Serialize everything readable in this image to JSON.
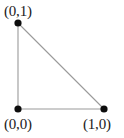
{
  "diagram": {
    "background_color": "#ffffff",
    "edge_color": "#9a9a9a",
    "vertex_color": "#0d0d0d",
    "label_color": "#1a1a1a",
    "vertices": [
      {
        "id": "top-left",
        "label": "(0,1)",
        "x": 18,
        "y": 23
      },
      {
        "id": "origin",
        "label": "(0,0)",
        "x": 18,
        "y": 109
      },
      {
        "id": "bottom-right",
        "label": "(1,0)",
        "x": 104,
        "y": 109
      }
    ],
    "edges": [
      {
        "id": "left-leg",
        "from": "top-left",
        "to": "origin"
      },
      {
        "id": "bottom-leg",
        "from": "origin",
        "to": "bottom-right"
      },
      {
        "id": "hypotenuse",
        "from": "top-left",
        "to": "bottom-right"
      }
    ]
  },
  "chart_data": {
    "type": "scatter",
    "title": "",
    "xlabel": "",
    "ylabel": "",
    "xlim": [
      0,
      1
    ],
    "ylim": [
      0,
      1
    ],
    "grid": false,
    "legend": null,
    "points": [
      {
        "label": "(0,1)",
        "x": 0,
        "y": 1
      },
      {
        "label": "(0,0)",
        "x": 0,
        "y": 0
      },
      {
        "label": "(1,0)",
        "x": 1,
        "y": 0
      }
    ],
    "annotations": [
      "(0,1)",
      "(0,0)",
      "(1,0)"
    ]
  }
}
